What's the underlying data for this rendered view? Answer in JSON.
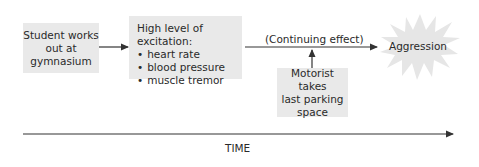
{
  "diagram": {
    "type": "causal-timeline",
    "nodes": {
      "stimulus": {
        "label": "Student works out at gymnasium",
        "lines": [
          "Student works",
          "out at",
          "gymnasium"
        ]
      },
      "arousal": {
        "heading": "High level of excitation:",
        "items": [
          "heart rate",
          "blood pressure",
          "muscle tremor"
        ]
      },
      "trigger": {
        "label": "Motorist takes last parking space",
        "lines": [
          "Motorist takes",
          "last parking",
          "space"
        ]
      },
      "outcome": {
        "label": "Aggression",
        "shape": "starburst"
      }
    },
    "edges": [
      {
        "from": "stimulus",
        "to": "arousal",
        "label": ""
      },
      {
        "from": "arousal",
        "to": "outcome",
        "label": "(Continuing effect)"
      },
      {
        "from": "trigger",
        "to": "arousal-outcome-edge",
        "label": ""
      }
    ],
    "axis": {
      "label": "TIME",
      "direction": "left-to-right"
    },
    "colors": {
      "box_fill": "#e9e9e9",
      "arrow": "#333333",
      "starburst_fill": "#e6e6e6"
    }
  }
}
